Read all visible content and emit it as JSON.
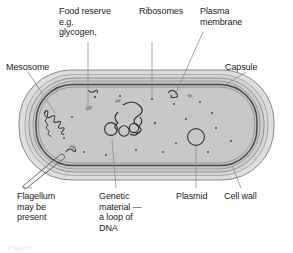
{
  "figure": {
    "caption": "Figure"
  },
  "labels": {
    "mesosome": "Mesosome",
    "food_reserve": "Food reserve\ne.g.\nglycogen,",
    "ribosomes": "Ribosomes",
    "plasma_membrane": "Plasma\nmembrane",
    "capsule": "Capsule",
    "flagellum": "Flagellum\nmay be\npresent",
    "genetic_material": "Genetic\nmaterial —\na loop of\nDNA",
    "plasmid": "Plasmid",
    "cell_wall": "Cell wall"
  },
  "colors": {
    "capsule_fill": "#dcdcdc",
    "cell_wall_fill": "#cfcfcf",
    "membrane_stroke": "#6e6e6e",
    "cytoplasm_fill": "#c9c9c9",
    "outline": "#555555",
    "leader_line": "#8a8a8a",
    "text": "#1c1c1c",
    "background": "#ffffff"
  },
  "structures": {
    "capsule": "outermost light grey envelope",
    "cell_wall": "second concentric layer",
    "plasma_membrane": "dark inner line bounding cytoplasm",
    "cytoplasm": "grey interior",
    "mesosome": "infolded membrane squiggle at left inner wall",
    "dna_loop": "tangled circular loop of DNA in centre-left",
    "plasmid": "small circle in right half",
    "ribosomes": "small dots scattered in cytoplasm",
    "food_reserve": "small granules in cytoplasm",
    "flagellum": "tube projecting from lower-left"
  }
}
